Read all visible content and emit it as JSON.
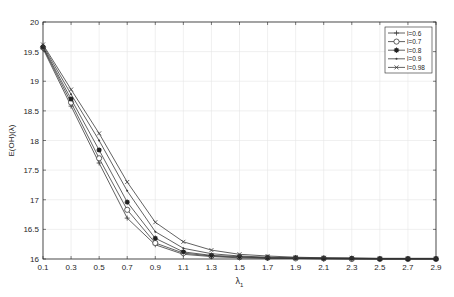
{
  "chart_data": {
    "type": "line",
    "title": "",
    "xlabel": "λ1",
    "ylabel": "E(OH)(λ)",
    "xlim": [
      0.1,
      2.9
    ],
    "ylim": [
      16,
      20
    ],
    "grid": true,
    "legend_position": "top-right",
    "x": [
      0.1,
      0.3,
      0.5,
      0.7,
      0.9,
      1.1,
      1.3,
      1.5,
      1.7,
      1.9,
      2.1,
      2.3,
      2.5,
      2.7,
      2.9
    ],
    "x_ticks": [
      "0.1",
      "0.3",
      "0.5",
      "0.7",
      "0.9",
      "1.1",
      "1.3",
      "1.5",
      "1.7",
      "1.9",
      "2.1",
      "2.3",
      "2.5",
      "2.7",
      "2.9"
    ],
    "y_ticks": [
      "16",
      "16.5",
      "17",
      "17.5",
      "18",
      "18.5",
      "19",
      "19.5",
      "20"
    ],
    "series": [
      {
        "name": "l=0.6",
        "marker": "plus",
        "values": [
          19.55,
          18.58,
          17.62,
          16.69,
          16.24,
          16.08,
          16.04,
          16.02,
          16.01,
          16.01,
          16.0,
          16.0,
          16.0,
          16.0,
          16.0
        ]
      },
      {
        "name": "l=0.7",
        "marker": "circle",
        "values": [
          19.57,
          18.64,
          17.7,
          16.83,
          16.27,
          16.1,
          16.05,
          16.03,
          16.02,
          16.01,
          16.01,
          16.0,
          16.0,
          16.0,
          16.0
        ]
      },
      {
        "name": "l=0.8",
        "marker": "star",
        "values": [
          19.58,
          18.7,
          17.84,
          16.96,
          16.35,
          16.12,
          16.06,
          16.04,
          16.02,
          16.02,
          16.01,
          16.01,
          16.0,
          16.0,
          16.0
        ]
      },
      {
        "name": "l=0.9",
        "marker": "point",
        "values": [
          19.6,
          18.78,
          18.0,
          17.15,
          16.46,
          16.18,
          16.09,
          16.05,
          16.03,
          16.02,
          16.02,
          16.01,
          16.01,
          16.01,
          16.01
        ]
      },
      {
        "name": "l=0.98",
        "marker": "x",
        "values": [
          19.62,
          18.86,
          18.12,
          17.3,
          16.62,
          16.29,
          16.15,
          16.08,
          16.05,
          16.03,
          16.02,
          16.02,
          16.01,
          16.01,
          16.01
        ]
      }
    ]
  },
  "colors": {
    "line": "#3a3a3a",
    "axis": "#262626",
    "grid": "#e6e6e6"
  }
}
